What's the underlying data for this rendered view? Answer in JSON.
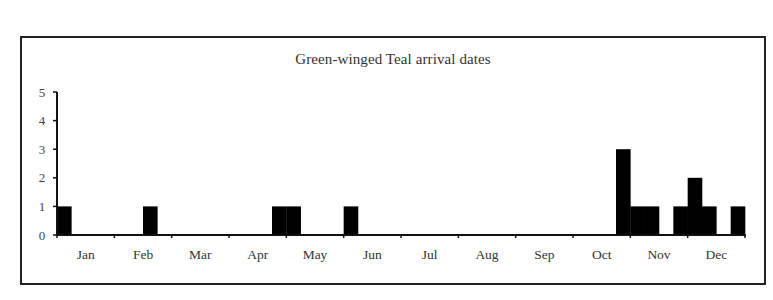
{
  "chart_data": {
    "type": "bar",
    "title": "Green-winged Teal arrival dates",
    "xlabel": "",
    "ylabel": "",
    "ylim": [
      0,
      5
    ],
    "yticks": [
      0,
      1,
      2,
      3,
      4,
      5
    ],
    "grid": false,
    "legend": null,
    "bin_unit": "week (4 bins per month, 48 bins per year)",
    "month_labels": [
      "Jan",
      "Feb",
      "Mar",
      "Apr",
      "May",
      "Jun",
      "Jul",
      "Aug",
      "Sep",
      "Oct",
      "Nov",
      "Dec"
    ],
    "bars": [
      {
        "bin": 0,
        "month": "Jan",
        "week": 1,
        "value": 1
      },
      {
        "bin": 6,
        "month": "Feb",
        "week": 3,
        "value": 1
      },
      {
        "bin": 15,
        "month": "Apr",
        "week": 4,
        "value": 1
      },
      {
        "bin": 16,
        "month": "May",
        "week": 1,
        "value": 1
      },
      {
        "bin": 20,
        "month": "Jun",
        "week": 1,
        "value": 1
      },
      {
        "bin": 39,
        "month": "Oct",
        "week": 4,
        "value": 3
      },
      {
        "bin": 40,
        "month": "Nov",
        "week": 1,
        "value": 1
      },
      {
        "bin": 41,
        "month": "Nov",
        "week": 2,
        "value": 1
      },
      {
        "bin": 43,
        "month": "Nov",
        "week": 4,
        "value": 1
      },
      {
        "bin": 44,
        "month": "Dec",
        "week": 1,
        "value": 2
      },
      {
        "bin": 45,
        "month": "Dec",
        "week": 2,
        "value": 1
      },
      {
        "bin": 47,
        "month": "Dec",
        "week": 4,
        "value": 1
      }
    ],
    "values": [
      1,
      0,
      0,
      0,
      0,
      0,
      1,
      0,
      0,
      0,
      0,
      0,
      0,
      0,
      0,
      1,
      1,
      0,
      0,
      0,
      1,
      0,
      0,
      0,
      0,
      0,
      0,
      0,
      0,
      0,
      0,
      0,
      0,
      0,
      0,
      0,
      0,
      0,
      0,
      3,
      1,
      1,
      0,
      1,
      2,
      1,
      0,
      1
    ]
  },
  "colors": {
    "bar": "#000000",
    "axis": "#111111",
    "frame": "#222222",
    "background": "#ffffff"
  }
}
